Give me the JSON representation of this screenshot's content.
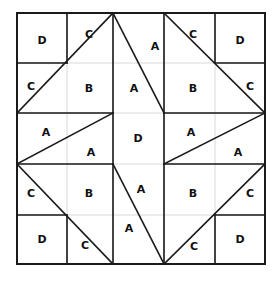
{
  "figure": {
    "kind": "quilt-block-pattern",
    "title": "",
    "block_grid": {
      "rows": 5,
      "cols": 5
    },
    "geometry": {
      "x_lines": [
        17,
        67,
        113,
        164,
        215,
        265
      ],
      "y_lines": [
        13,
        63,
        113,
        164,
        215,
        264
      ],
      "left": 17,
      "top": 13,
      "right": 265,
      "bottom": 264
    },
    "colors": {
      "background": "#ffffff",
      "pattern_line": "#1a1a1a",
      "grid_line": "#d8d8d8",
      "border": "#1a1a1a",
      "label_text": "#111111"
    },
    "stroke": {
      "pattern_width": 1.6,
      "border_width": 2.0,
      "grid_width": 1.0
    },
    "patch_labels": [
      {
        "id": "p1",
        "text": "D",
        "x": 42,
        "y": 40
      },
      {
        "id": "p2",
        "text": "C",
        "x": 89,
        "y": 34
      },
      {
        "id": "p3",
        "text": "A",
        "x": 155,
        "y": 46
      },
      {
        "id": "p4",
        "text": "C",
        "x": 193,
        "y": 34
      },
      {
        "id": "p5",
        "text": "D",
        "x": 240,
        "y": 40
      },
      {
        "id": "p6",
        "text": "C",
        "x": 31,
        "y": 86
      },
      {
        "id": "p7",
        "text": "B",
        "x": 89,
        "y": 88
      },
      {
        "id": "p8",
        "text": "A",
        "x": 134,
        "y": 88
      },
      {
        "id": "p9",
        "text": "B",
        "x": 193,
        "y": 88
      },
      {
        "id": "p10",
        "text": "C",
        "x": 250,
        "y": 86
      },
      {
        "id": "p11",
        "text": "A",
        "x": 46,
        "y": 132
      },
      {
        "id": "p12",
        "text": "A",
        "x": 91,
        "y": 152
      },
      {
        "id": "p13",
        "text": "D",
        "x": 138,
        "y": 138
      },
      {
        "id": "p14",
        "text": "A",
        "x": 191,
        "y": 132
      },
      {
        "id": "p15",
        "text": "A",
        "x": 238,
        "y": 152
      },
      {
        "id": "p16",
        "text": "C",
        "x": 31,
        "y": 193
      },
      {
        "id": "p17",
        "text": "B",
        "x": 89,
        "y": 193
      },
      {
        "id": "p18",
        "text": "A",
        "x": 141,
        "y": 189
      },
      {
        "id": "p19",
        "text": "B",
        "x": 193,
        "y": 193
      },
      {
        "id": "p20",
        "text": "C",
        "x": 250,
        "y": 193
      },
      {
        "id": "p21",
        "text": "D",
        "x": 42,
        "y": 239
      },
      {
        "id": "p22",
        "text": "C",
        "x": 85,
        "y": 245
      },
      {
        "id": "p23",
        "text": "A",
        "x": 129,
        "y": 228
      },
      {
        "id": "p24",
        "text": "C",
        "x": 194,
        "y": 246
      },
      {
        "id": "p25",
        "text": "D",
        "x": 240,
        "y": 239
      }
    ],
    "grid_lines": [
      {
        "id": "gv1",
        "x1": 67,
        "y1": 13,
        "x2": 67,
        "y2": 264
      },
      {
        "id": "gv2",
        "x1": 113,
        "y1": 13,
        "x2": 113,
        "y2": 264
      },
      {
        "id": "gv3",
        "x1": 164,
        "y1": 13,
        "x2": 164,
        "y2": 264
      },
      {
        "id": "gv4",
        "x1": 215,
        "y1": 13,
        "x2": 215,
        "y2": 264
      },
      {
        "id": "gh1",
        "x1": 17,
        "y1": 63,
        "x2": 265,
        "y2": 63
      },
      {
        "id": "gh2",
        "x1": 17,
        "y1": 113,
        "x2": 265,
        "y2": 113
      },
      {
        "id": "gh3",
        "x1": 17,
        "y1": 164,
        "x2": 265,
        "y2": 164
      },
      {
        "id": "gh4",
        "x1": 17,
        "y1": 215,
        "x2": 265,
        "y2": 215
      }
    ],
    "pattern_lines": [
      {
        "id": "b-top",
        "x1": 17,
        "y1": 13,
        "x2": 265,
        "y2": 13
      },
      {
        "id": "b-bottom",
        "x1": 17,
        "y1": 264,
        "x2": 265,
        "y2": 264
      },
      {
        "id": "b-left",
        "x1": 17,
        "y1": 13,
        "x2": 17,
        "y2": 264
      },
      {
        "id": "b-right",
        "x1": 265,
        "y1": 13,
        "x2": 265,
        "y2": 264
      },
      {
        "id": "s-v1",
        "x1": 67,
        "y1": 13,
        "x2": 67,
        "y2": 63
      },
      {
        "id": "s-h1",
        "x1": 17,
        "y1": 63,
        "x2": 67,
        "y2": 63
      },
      {
        "id": "s-d1",
        "x1": 17,
        "y1": 113,
        "x2": 113,
        "y2": 13
      },
      {
        "id": "s-h2",
        "x1": 17,
        "y1": 113,
        "x2": 113,
        "y2": 113
      },
      {
        "id": "s-v2",
        "x1": 113,
        "y1": 13,
        "x2": 113,
        "y2": 113
      },
      {
        "id": "s-d2",
        "x1": 113,
        "y1": 13,
        "x2": 164,
        "y2": 113
      },
      {
        "id": "s-v3",
        "x1": 164,
        "y1": 13,
        "x2": 164,
        "y2": 113
      },
      {
        "id": "s-v4",
        "x1": 215,
        "y1": 13,
        "x2": 215,
        "y2": 63
      },
      {
        "id": "s-h3",
        "x1": 215,
        "y1": 63,
        "x2": 265,
        "y2": 63
      },
      {
        "id": "s-d3",
        "x1": 164,
        "y1": 13,
        "x2": 265,
        "y2": 113
      },
      {
        "id": "s-h4",
        "x1": 164,
        "y1": 113,
        "x2": 265,
        "y2": 113
      },
      {
        "id": "s-d4",
        "x1": 17,
        "y1": 164,
        "x2": 113,
        "y2": 113
      },
      {
        "id": "s-h5",
        "x1": 17,
        "y1": 164,
        "x2": 113,
        "y2": 164
      },
      {
        "id": "s-v5",
        "x1": 113,
        "y1": 113,
        "x2": 113,
        "y2": 164
      },
      {
        "id": "s-v6",
        "x1": 164,
        "y1": 113,
        "x2": 164,
        "y2": 164
      },
      {
        "id": "s-d5",
        "x1": 164,
        "y1": 164,
        "x2": 265,
        "y2": 113
      },
      {
        "id": "s-h6",
        "x1": 164,
        "y1": 164,
        "x2": 265,
        "y2": 164
      },
      {
        "id": "s-d6",
        "x1": 17,
        "y1": 164,
        "x2": 113,
        "y2": 264
      },
      {
        "id": "s-h7",
        "x1": 17,
        "y1": 215,
        "x2": 67,
        "y2": 215
      },
      {
        "id": "s-v7",
        "x1": 67,
        "y1": 215,
        "x2": 67,
        "y2": 264
      },
      {
        "id": "s-v8",
        "x1": 113,
        "y1": 164,
        "x2": 113,
        "y2": 264
      },
      {
        "id": "s-d7",
        "x1": 113,
        "y1": 164,
        "x2": 164,
        "y2": 264
      },
      {
        "id": "s-v9",
        "x1": 164,
        "y1": 164,
        "x2": 164,
        "y2": 264
      },
      {
        "id": "s-d8",
        "x1": 164,
        "y1": 264,
        "x2": 265,
        "y2": 164
      },
      {
        "id": "s-h8",
        "x1": 215,
        "y1": 215,
        "x2": 265,
        "y2": 215
      },
      {
        "id": "s-v10",
        "x1": 215,
        "y1": 215,
        "x2": 215,
        "y2": 264
      }
    ]
  }
}
